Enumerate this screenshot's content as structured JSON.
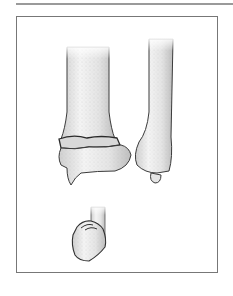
{
  "figure": {
    "elements": [
      {
        "name": "radius-shaft",
        "label": ""
      },
      {
        "name": "fracture-line",
        "label": ""
      },
      {
        "name": "distal-fragment",
        "label": ""
      },
      {
        "name": "ulna-shaft",
        "label": ""
      },
      {
        "name": "ulna-styloid",
        "label": ""
      },
      {
        "name": "lower-bone-stump",
        "label": ""
      },
      {
        "name": "detached-fragment",
        "label": ""
      }
    ],
    "colors": {
      "frame_border": "#777777",
      "top_rule": "#9a9a9a",
      "bone_fill": "#e9e9e9",
      "bone_outline": "#3a3a3a"
    }
  }
}
